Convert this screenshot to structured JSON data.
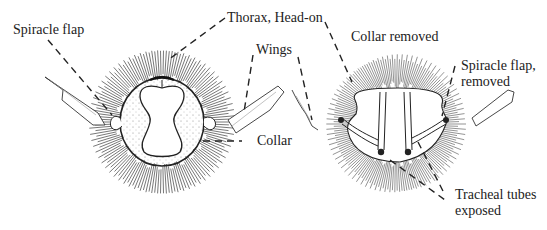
{
  "diagram": {
    "labels": {
      "spiracle_flap": "Spiracle flap",
      "thorax": "Thorax, Head-on",
      "wings": "Wings",
      "collar": "Collar",
      "collar_removed": "Collar removed",
      "spiracle_flap_removed_line1": "Spiracle flap,",
      "spiracle_flap_removed_line2": "removed",
      "tracheal_line1": "Tracheal tubes",
      "tracheal_line2": "exposed"
    },
    "panels": [
      {
        "name": "left",
        "description": "Thorax with collar intact"
      },
      {
        "name": "right",
        "description": "Thorax with collar removed, tracheal tubes exposed"
      }
    ],
    "colors": {
      "ink": "#222222",
      "hair": "#555555",
      "background": "#ffffff"
    }
  }
}
